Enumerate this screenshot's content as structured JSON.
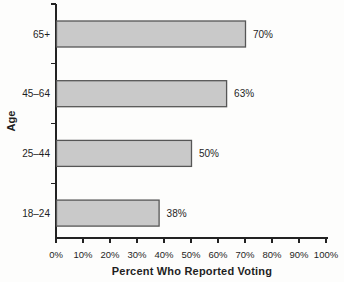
{
  "chart_data": {
    "type": "bar",
    "orientation": "horizontal",
    "title": "",
    "xlabel": "Percent Who Reported Voting",
    "ylabel": "Age",
    "categories": [
      "65+",
      "45–64",
      "25–44",
      "18–24"
    ],
    "values": [
      70,
      63,
      50,
      38
    ],
    "value_labels": [
      "70%",
      "63%",
      "50%",
      "38%"
    ],
    "xlim": [
      0,
      100
    ],
    "x_ticks": [
      0,
      10,
      20,
      30,
      40,
      50,
      60,
      70,
      80,
      90,
      100
    ],
    "x_tick_labels": [
      "0%",
      "10%",
      "20%",
      "30%",
      "40%",
      "50%",
      "60%",
      "70%",
      "80%",
      "90%",
      "100%"
    ],
    "grid": false,
    "legend": null,
    "bar_fill_color": "#c9c9c9",
    "bar_border_color": "#565656",
    "axis_color": "#222222",
    "text_color": "#1f1f1f"
  }
}
